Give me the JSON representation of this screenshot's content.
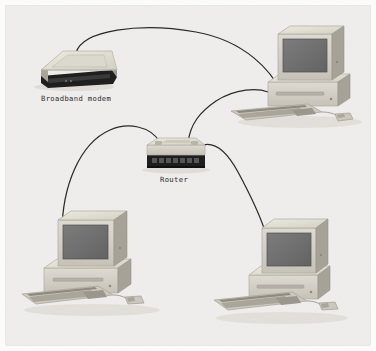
{
  "diagram": {
    "background_color": "#f2f2f2",
    "frame_color": "#d8d8d8",
    "cable_color": "#2a2a2a",
    "device_body_color": "#d4d0c6",
    "device_top_color": "#e6e3da",
    "device_side_color": "#a8a49a",
    "screen_color": "#6f6f6f",
    "panel_dark_color": "#232323"
  },
  "labels": {
    "modem": "Broadband modem",
    "router": "Router"
  },
  "devices": [
    {
      "id": "broadband-modem",
      "type": "modem",
      "label": "Broadband modem",
      "label_visible": true,
      "position": {
        "x": 36,
        "y": 52
      }
    },
    {
      "id": "router",
      "type": "router",
      "label": "Router",
      "label_visible": true,
      "position": {
        "x": 145,
        "y": 145
      }
    },
    {
      "id": "computer-top-right",
      "type": "computer",
      "label": "",
      "label_visible": false,
      "position": {
        "x": 265,
        "y": 30
      }
    },
    {
      "id": "computer-bottom-left",
      "type": "computer",
      "label": "",
      "label_visible": false,
      "position": {
        "x": 28,
        "y": 212
      }
    },
    {
      "id": "computer-bottom-right",
      "type": "computer",
      "label": "",
      "label_visible": false,
      "position": {
        "x": 212,
        "y": 208
      }
    }
  ],
  "connections": [
    {
      "id": "cable-modem-to-computer-top-right",
      "from": "broadband-modem",
      "to": "computer-top-right"
    },
    {
      "id": "cable-router-to-computer-top-right",
      "from": "router",
      "to": "computer-top-right"
    },
    {
      "id": "cable-router-to-computer-bottom-left",
      "from": "router",
      "to": "computer-bottom-left"
    },
    {
      "id": "cable-router-to-computer-bottom-right",
      "from": "router",
      "to": "computer-bottom-right"
    }
  ]
}
